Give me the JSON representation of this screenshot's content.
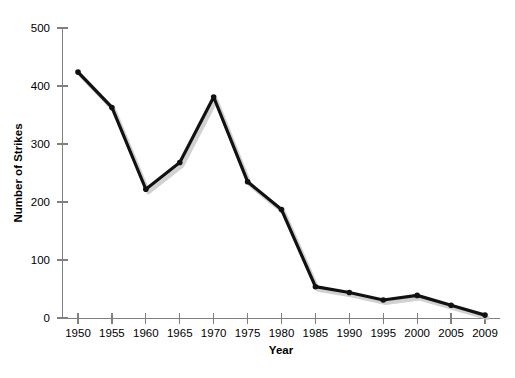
{
  "chart_data": {
    "type": "line",
    "title": "",
    "subtitle": "",
    "xlabel": "Year",
    "ylabel": "Number of Strikes",
    "categories": [
      "1950",
      "1955",
      "1960",
      "1965",
      "1970",
      "1975",
      "1980",
      "1985",
      "1990",
      "1995",
      "2000",
      "2005",
      "2009"
    ],
    "x": [
      1950,
      1955,
      1960,
      1965,
      1970,
      1975,
      1980,
      1985,
      1990,
      1995,
      2000,
      2005,
      2009
    ],
    "values": [
      424,
      363,
      222,
      268,
      381,
      235,
      187,
      54,
      44,
      31,
      39,
      22,
      5
    ],
    "series": [
      {
        "name": "Number of Strikes",
        "values": [
          424,
          363,
          222,
          268,
          381,
          235,
          187,
          54,
          44,
          31,
          39,
          22,
          5
        ]
      }
    ],
    "ylim": [
      0,
      500
    ],
    "yticks": [
      0,
      100,
      200,
      300,
      400,
      500
    ],
    "ytick_labels": [
      "0",
      "100",
      "200",
      "300",
      "400",
      "500"
    ],
    "xtick_labels": [
      "1950",
      "1955",
      "1960",
      "1965",
      "1970",
      "1975",
      "1980",
      "1985",
      "1990",
      "1995",
      "2000",
      "2005",
      "2009"
    ],
    "grid": false,
    "legend": false,
    "legend_position": "none",
    "marker": "circle",
    "line_color": "#111111",
    "shadow_color": "#c9c9c9",
    "axis_color": "#808080",
    "background_color": "#ffffff"
  }
}
